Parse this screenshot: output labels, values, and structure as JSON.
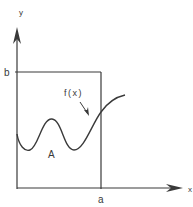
{
  "diagram": {
    "axes": {
      "y_label": "y",
      "x_label": "x"
    },
    "ticks": {
      "b_label": "b",
      "a_label": "a"
    },
    "curve": {
      "label": "f(x)",
      "region_label": "A"
    },
    "colors": {
      "stroke": "#3a3a3a",
      "background": "#ffffff"
    }
  }
}
